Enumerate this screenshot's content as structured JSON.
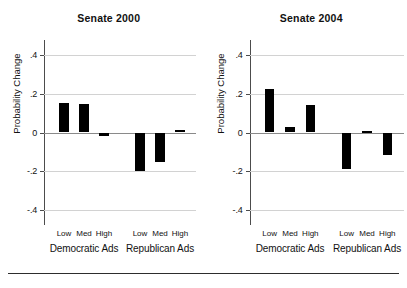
{
  "figure": {
    "y_axis_title": "Probability Change",
    "y_ticks": [
      ".4",
      ".2",
      "0",
      "-.2",
      "-.4"
    ],
    "group_labels": [
      "Democratic Ads",
      "Republican Ads"
    ],
    "category_labels": [
      "Low",
      "Med",
      "High"
    ]
  },
  "chart_data": [
    {
      "type": "bar",
      "title": "Senate 2000",
      "xlabel": "",
      "ylabel": "Probability Change",
      "ylim": [
        -0.5,
        0.5
      ],
      "yticks": [
        0.4,
        0.2,
        0,
        -0.2,
        -0.4
      ],
      "ytick_labels": [
        ".4",
        ".2",
        "0",
        "-.2",
        "-.4"
      ],
      "grid": true,
      "legend": "none",
      "groups": [
        "Democratic Ads",
        "Republican Ads"
      ],
      "categories": [
        "Low",
        "Med",
        "High",
        "Low",
        "Med",
        "High"
      ],
      "values": [
        0.15,
        0.145,
        -0.02,
        -0.2,
        -0.15,
        0.015
      ]
    },
    {
      "type": "bar",
      "title": "Senate 2004",
      "xlabel": "",
      "ylabel": "Probability Change",
      "ylim": [
        -0.5,
        0.5
      ],
      "yticks": [
        0.4,
        0.2,
        0,
        -0.2,
        -0.4
      ],
      "ytick_labels": [
        ".4",
        ".2",
        "0",
        "-.2",
        "-.4"
      ],
      "grid": true,
      "legend": "none",
      "groups": [
        "Democratic Ads",
        "Republican Ads"
      ],
      "categories": [
        "Low",
        "Med",
        "High",
        "Low",
        "Med",
        "High"
      ],
      "values": [
        0.225,
        0.03,
        0.14,
        -0.185,
        0.01,
        -0.115
      ]
    }
  ]
}
